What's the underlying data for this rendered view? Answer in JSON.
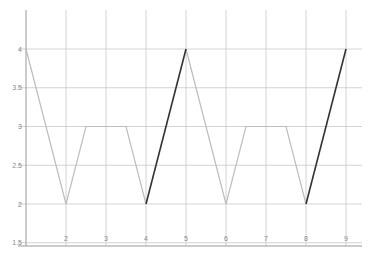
{
  "chart_data": {
    "type": "line",
    "title": "",
    "xlabel": "",
    "ylabel": "",
    "x_tick_labels": [
      "1",
      "2",
      "3",
      "4",
      "5",
      "6",
      "7",
      "8",
      "9"
    ],
    "y_tick_labels": [
      "4",
      "3.5",
      "3",
      "2.5",
      "2",
      "1.5"
    ],
    "y_ticks": [
      4,
      3.5,
      3,
      2.5,
      2,
      1.5
    ],
    "ylim": [
      1.5,
      4.3
    ],
    "xlim": [
      0,
      8.3
    ],
    "grid": true,
    "legend": null,
    "series": [
      {
        "name": "light",
        "color": "#bdbdbd",
        "points": [
          [
            0,
            4
          ],
          [
            1,
            2
          ],
          [
            1.5,
            3
          ],
          [
            2.5,
            3
          ],
          [
            3,
            2
          ],
          [
            3,
            2
          ]
        ],
        "segments": [
          [
            [
              0,
              4
            ],
            [
              1,
              2
            ],
            [
              1.5,
              3
            ],
            [
              2.5,
              3
            ],
            [
              3,
              2
            ]
          ],
          [
            [
              4,
              4
            ],
            [
              5,
              2
            ],
            [
              5.5,
              3
            ],
            [
              6.5,
              3
            ],
            [
              7,
              2
            ]
          ]
        ]
      },
      {
        "name": "dark",
        "color": "#333333",
        "segments": [
          [
            [
              3,
              2
            ],
            [
              4,
              4
            ]
          ],
          [
            [
              7,
              2
            ],
            [
              8,
              4
            ]
          ]
        ]
      }
    ],
    "x": [
      0,
      1,
      1.5,
      2.5,
      3,
      4,
      5,
      5.5,
      6.5,
      7,
      8
    ],
    "values": [
      4,
      2,
      3,
      3,
      2,
      4,
      2,
      3,
      3,
      2,
      4
    ]
  },
  "colors": {
    "grid": "#c8c8c8",
    "axis": "#999999",
    "light_line": "#bdbdbd",
    "dark_line": "#333333"
  }
}
